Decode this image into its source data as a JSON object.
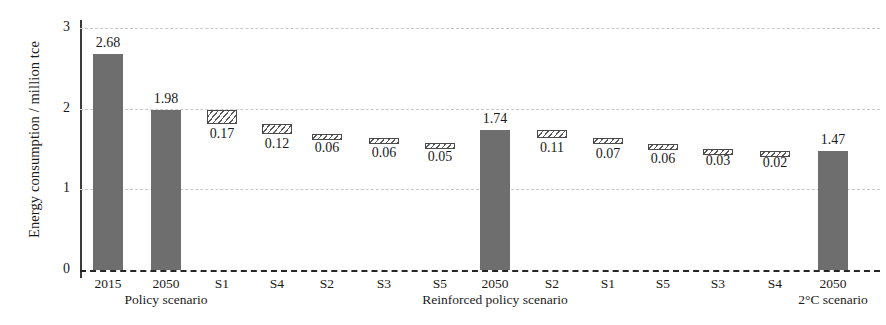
{
  "chart_data": {
    "type": "bar",
    "title": "",
    "xlabel": "",
    "ylabel": "Energy consumption / million tce",
    "ylim": [
      0,
      3
    ],
    "yticks": [
      0,
      1,
      2,
      3
    ],
    "ytick_labels": [
      "0",
      "1",
      "2",
      "3"
    ],
    "grid": true,
    "legend": "none",
    "chart_style": "waterfall",
    "categories": [
      "2015",
      "2050",
      "S1",
      "S4",
      "S2",
      "S3",
      "S5",
      "2050",
      "S2",
      "S1",
      "S5",
      "S3",
      "S4",
      "2050"
    ],
    "values": [
      2.68,
      1.98,
      0.17,
      0.12,
      0.06,
      0.06,
      0.05,
      1.74,
      0.11,
      0.07,
      0.06,
      0.03,
      0.02,
      1.47
    ],
    "value_labels": [
      "2.68",
      "1.98",
      "0.17",
      "0.12",
      "0.06",
      "0.06",
      "0.05",
      "1.74",
      "0.11",
      "0.07",
      "0.06",
      "0.03",
      "0.02",
      "1.47"
    ],
    "bar_kinds": [
      "total",
      "total",
      "delta",
      "delta",
      "delta",
      "delta",
      "delta",
      "total",
      "delta",
      "delta",
      "delta",
      "delta",
      "delta",
      "total"
    ],
    "bar_tops": [
      2.68,
      1.98,
      1.98,
      1.81,
      1.69,
      1.63,
      1.57,
      1.74,
      1.74,
      1.63,
      1.56,
      1.5,
      1.47,
      1.47
    ],
    "bar_bottoms": [
      0,
      0,
      1.81,
      1.69,
      1.63,
      1.57,
      1.52,
      0,
      1.63,
      1.56,
      1.5,
      1.47,
      1.45,
      0
    ],
    "group_labels": [
      {
        "text": "Policy scenario",
        "center_index": 1
      },
      {
        "text": "Reinforced policy scenario",
        "center_index": 7
      },
      {
        "text": "2°C scenario",
        "center_index": 13
      }
    ],
    "series": [
      {
        "name": "Policy scenario",
        "start": 2.68,
        "end": 1.98,
        "steps": [
          {
            "label": "S1",
            "value": 0.17
          },
          {
            "label": "S4",
            "value": 0.12
          },
          {
            "label": "S2",
            "value": 0.06
          },
          {
            "label": "S3",
            "value": 0.06
          },
          {
            "label": "S5",
            "value": 0.05
          }
        ]
      },
      {
        "name": "Reinforced policy scenario",
        "start": 1.98,
        "end": 1.74,
        "steps": [
          {
            "label": "S2",
            "value": 0.11
          },
          {
            "label": "S1",
            "value": 0.07
          },
          {
            "label": "S5",
            "value": 0.06
          },
          {
            "label": "S3",
            "value": 0.03
          },
          {
            "label": "S4",
            "value": 0.02
          }
        ]
      },
      {
        "name": "2°C scenario",
        "start": 1.74,
        "end": 1.47,
        "steps": []
      }
    ],
    "colors": {
      "total_bar": "#6e6e6e",
      "delta_bar_edge": "#4a4a4a",
      "delta_bar_fill": "#ffffff",
      "gridline": "#c9c9c9",
      "baseline": "#262626",
      "text": "#1a1a1a"
    }
  },
  "geometry": {
    "plot_left": 80,
    "plot_top": 8,
    "plot_width": 800,
    "plot_height": 270,
    "baseline_y": 262,
    "unit_px": 80.7,
    "bar_width": 30,
    "bar_centers": [
      28,
      86,
      142,
      197,
      247,
      304,
      360,
      415,
      472,
      528,
      583,
      638,
      695,
      753
    ]
  }
}
